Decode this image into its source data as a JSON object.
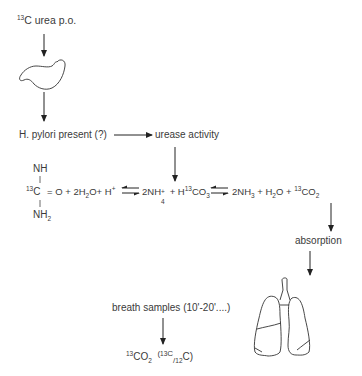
{
  "diagram": {
    "start": {
      "iso": "13",
      "label": "C urea p.o."
    },
    "stomach": {
      "icon": "stomach-icon"
    },
    "hpylori": {
      "label": "H. pylori present (?)"
    },
    "urease": {
      "label": "urease activity"
    },
    "urea": {
      "nh": "NH",
      "iso": "13",
      "c": "C",
      "nh2": "NH",
      "nh2_sub": "2"
    },
    "reaction": {
      "lhs_a": "= O + 2H",
      "lhs_a_sub": "2",
      "lhs_b": "O+ H",
      "lhs_b_sup": "+",
      "mid_a": "2NH",
      "mid_a_sub": "4",
      "mid_a_sup": "+",
      "mid_b": " + H",
      "mid_b_sup": "13",
      "mid_c": "CO",
      "mid_c_sub": "3",
      "rhs_a": "2NH",
      "rhs_a_sub": "3",
      "rhs_b": " + H",
      "rhs_b_sub": "2",
      "rhs_c": "O + ",
      "rhs_c_sup": "13",
      "rhs_d": "CO",
      "rhs_d_sub": "2"
    },
    "absorption": {
      "label": "absorption"
    },
    "lungs": {
      "icon": "lungs-icon"
    },
    "breath": {
      "label": "breath samples (10'-20'....)"
    },
    "result": {
      "iso1": "13",
      "co": "CO",
      "co_sub": "2",
      "paren_open": "(",
      "iso2": "13",
      "c1": "C",
      "slash": "/",
      "iso3": "12",
      "c2": "C)"
    }
  }
}
